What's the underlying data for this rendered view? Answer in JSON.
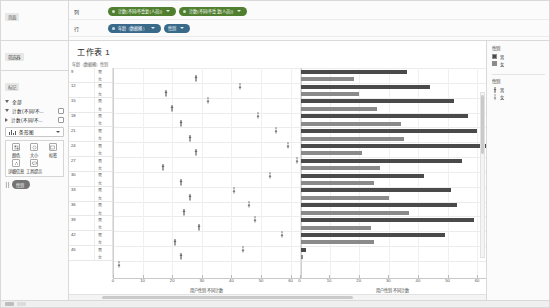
{
  "window": {
    "data_pane_title": "页面",
    "filters_pane_title": "筛选器",
    "marks_pane_title": "标记"
  },
  "shelves": {
    "rows_label": "行",
    "columns_label": "列",
    "columns_pills": [
      {
        "text": "计数(不同/不重复(人员))",
        "color": "green"
      },
      {
        "text": "计数(不同/不重复(人员))",
        "color": "green"
      }
    ],
    "rows_pills": [
      {
        "text": "年龄（数据桶）",
        "color": "blue"
      },
      {
        "text": "性别",
        "color": "blue"
      }
    ]
  },
  "marks_card": {
    "items": [
      {
        "label": "全部",
        "expanded": true
      },
      {
        "label": "计数(不同/不...",
        "expanded": true
      },
      {
        "label": "计数(不同/不...",
        "expanded": false
      }
    ],
    "mark_type": "条形图",
    "properties": [
      {
        "label": "颜色",
        "icon": "color-icon"
      },
      {
        "label": "大小",
        "icon": "size-icon"
      },
      {
        "label": "标签",
        "icon": "label-icon"
      },
      {
        "label": "详细信息",
        "icon": "detail-icon"
      },
      {
        "label": "工具提示",
        "icon": "tooltip-icon"
      }
    ],
    "encoded_pill": {
      "text": "性别",
      "color": "dim"
    }
  },
  "sheet": {
    "title": "工作表 1",
    "column_headers": [
      "年龄（数据桶）",
      "性别"
    ]
  },
  "legends": [
    {
      "title": "性别",
      "type": "color",
      "items": [
        {
          "label": "男",
          "color": "#4a4a4a"
        },
        {
          "label": "女",
          "color": "#8a8a8a"
        }
      ]
    },
    {
      "title": "性别",
      "type": "shape",
      "items": [
        {
          "label": "男",
          "shape": "male-figure"
        },
        {
          "label": "女",
          "shape": "female-figure"
        }
      ]
    }
  ],
  "chart_data": [
    {
      "type": "scatter",
      "title": "工作表 1",
      "xlabel": "用户性别 不同计数",
      "ylabel": "年龄（数据桶）",
      "xlim": [
        0,
        63
      ],
      "xticks": [
        0,
        10,
        20,
        30,
        40,
        50,
        60
      ],
      "grid": true,
      "legend_position": "right",
      "row_groups": [
        {
          "age": "9",
          "rows": [
            {
              "sex": "男",
              "value": 28
            },
            {
              "sex": "女",
              "value": 43
            }
          ]
        },
        {
          "age": "12",
          "rows": [
            {
              "sex": "男",
              "value": 18
            },
            {
              "sex": "女",
              "value": 32
            }
          ]
        },
        {
          "age": "15",
          "rows": [
            {
              "sex": "男",
              "value": 20
            },
            {
              "sex": "女",
              "value": 49
            }
          ]
        },
        {
          "age": "18",
          "rows": [
            {
              "sex": "男",
              "value": 23
            },
            {
              "sex": "女",
              "value": 55
            }
          ]
        },
        {
          "age": "21",
          "rows": [
            {
              "sex": "男",
              "value": 26
            },
            {
              "sex": "女",
              "value": 59
            }
          ]
        },
        {
          "age": "24",
          "rows": [
            {
              "sex": "男",
              "value": 28
            },
            {
              "sex": "女",
              "value": 62
            }
          ]
        },
        {
          "age": "27",
          "rows": [
            {
              "sex": "男",
              "value": 17
            },
            {
              "sex": "女",
              "value": 53
            }
          ]
        },
        {
          "age": "30",
          "rows": [
            {
              "sex": "男",
              "value": 23
            },
            {
              "sex": "女",
              "value": 41
            }
          ]
        },
        {
          "age": "33",
          "rows": [
            {
              "sex": "男",
              "value": 26
            },
            {
              "sex": "女",
              "value": 46
            }
          ]
        },
        {
          "age": "36",
          "rows": [
            {
              "sex": "男",
              "value": 24
            },
            {
              "sex": "女",
              "value": 48
            }
          ]
        },
        {
          "age": "39",
          "rows": [
            {
              "sex": "男",
              "value": 29
            },
            {
              "sex": "女",
              "value": 57
            }
          ]
        },
        {
          "age": "42",
          "rows": [
            {
              "sex": "男",
              "value": 21
            },
            {
              "sex": "女",
              "value": 44
            }
          ]
        },
        {
          "age": "45",
          "rows": [
            {
              "sex": "男",
              "value": 23
            },
            {
              "sex": "女",
              "value": 2
            }
          ]
        }
      ]
    },
    {
      "type": "bar",
      "xlabel": "用户性别 不同计数",
      "ylabel": "年龄（数据桶）",
      "xlim": [
        0,
        63
      ],
      "xticks": [
        0,
        10,
        20,
        30,
        40,
        50,
        60
      ],
      "grid": true,
      "legend_position": "right",
      "series": [
        {
          "name": "男",
          "color": "#4a4a4a"
        },
        {
          "name": "女",
          "color": "#8a8a8a"
        }
      ],
      "categories": [
        "9",
        "12",
        "15",
        "18",
        "21",
        "24",
        "27",
        "30",
        "33",
        "36",
        "39",
        "42",
        "45"
      ],
      "row_groups": [
        {
          "age": "9",
          "rows": [
            {
              "sex": "男",
              "value": 36
            },
            {
              "sex": "女",
              "value": 18
            }
          ]
        },
        {
          "age": "12",
          "rows": [
            {
              "sex": "男",
              "value": 44
            },
            {
              "sex": "女",
              "value": 20
            }
          ]
        },
        {
          "age": "15",
          "rows": [
            {
              "sex": "男",
              "value": 52
            },
            {
              "sex": "女",
              "value": 26
            }
          ]
        },
        {
          "age": "18",
          "rows": [
            {
              "sex": "男",
              "value": 57
            },
            {
              "sex": "女",
              "value": 34
            }
          ]
        },
        {
          "age": "21",
          "rows": [
            {
              "sex": "男",
              "value": 60
            },
            {
              "sex": "女",
              "value": 35
            }
          ]
        },
        {
          "age": "24",
          "rows": [
            {
              "sex": "男",
              "value": 63
            },
            {
              "sex": "女",
              "value": 21
            }
          ]
        },
        {
          "age": "27",
          "rows": [
            {
              "sex": "男",
              "value": 55
            },
            {
              "sex": "女",
              "value": 27
            }
          ]
        },
        {
          "age": "30",
          "rows": [
            {
              "sex": "男",
              "value": 42
            },
            {
              "sex": "女",
              "value": 25
            }
          ]
        },
        {
          "age": "33",
          "rows": [
            {
              "sex": "男",
              "value": 51
            },
            {
              "sex": "女",
              "value": 30
            }
          ]
        },
        {
          "age": "36",
          "rows": [
            {
              "sex": "男",
              "value": 53
            },
            {
              "sex": "女",
              "value": 37
            }
          ]
        },
        {
          "age": "39",
          "rows": [
            {
              "sex": "男",
              "value": 59
            },
            {
              "sex": "女",
              "value": 24
            }
          ]
        },
        {
          "age": "42",
          "rows": [
            {
              "sex": "男",
              "value": 49
            },
            {
              "sex": "女",
              "value": 25
            }
          ]
        },
        {
          "age": "45",
          "rows": [
            {
              "sex": "男",
              "value": 2
            },
            {
              "sex": "女",
              "value": 1
            }
          ]
        }
      ]
    }
  ]
}
